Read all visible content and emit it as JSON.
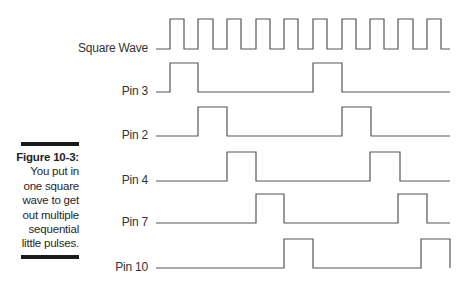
{
  "figure": {
    "number_label": "Figure 10-3:",
    "caption": "You put in one square wave to get out multiple sequential little pulses.",
    "caption_lines": [
      "You put in",
      "one square",
      "wave to get",
      "out multiple",
      "sequential",
      "little pulses."
    ]
  },
  "colors": {
    "waveform": "#555555",
    "label": "#333333",
    "rule": "#1a1a1a",
    "caption": "#1f1f1f"
  },
  "signals": [
    {
      "name": "Square Wave",
      "label_y": 49,
      "baseline_y": 49,
      "high_y": 19,
      "pulses": [
        [
          170,
          184
        ],
        [
          198,
          213
        ],
        [
          227,
          241
        ],
        [
          256,
          270
        ],
        [
          284,
          298
        ],
        [
          313,
          327
        ],
        [
          342,
          356
        ],
        [
          370,
          384
        ],
        [
          398,
          413
        ],
        [
          427,
          441
        ]
      ],
      "start_x": 156,
      "end_x": 450
    },
    {
      "name": "Pin 3",
      "label_y": 92,
      "baseline_y": 92,
      "high_y": 63,
      "pulses": [
        [
          170,
          198
        ],
        [
          313,
          342
        ]
      ],
      "start_x": 156,
      "end_x": 450
    },
    {
      "name": "Pin 2",
      "label_y": 136,
      "baseline_y": 136,
      "high_y": 107,
      "pulses": [
        [
          198,
          227
        ],
        [
          342,
          371
        ]
      ],
      "start_x": 156,
      "end_x": 450
    },
    {
      "name": "Pin 4",
      "label_y": 181,
      "baseline_y": 181,
      "high_y": 152,
      "pulses": [
        [
          227,
          256
        ],
        [
          370,
          400
        ]
      ],
      "start_x": 156,
      "end_x": 450
    },
    {
      "name": "Pin 7",
      "label_y": 223,
      "baseline_y": 223,
      "high_y": 194,
      "pulses": [
        [
          256,
          284
        ],
        [
          398,
          427
        ]
      ],
      "start_x": 156,
      "end_x": 450
    },
    {
      "name": "Pin 10",
      "label_y": 268,
      "baseline_y": 268,
      "high_y": 239,
      "pulses": [
        [
          284,
          313
        ],
        [
          421,
          450
        ]
      ],
      "start_x": 156,
      "end_x": 450
    }
  ],
  "labels": {
    "square_wave": "Square Wave",
    "pin3": "Pin 3",
    "pin2": "Pin 2",
    "pin4": "Pin 4",
    "pin7": "Pin 7",
    "pin10": "Pin 10"
  }
}
